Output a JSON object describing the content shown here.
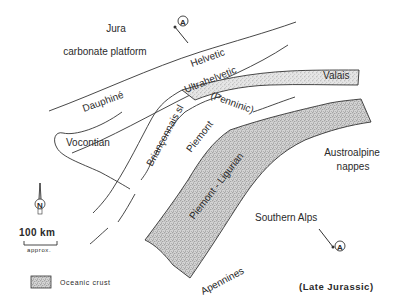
{
  "map": {
    "period": "(Late Jurassic)",
    "colors": {
      "line": "#333333",
      "text": "#2a2a2a",
      "oceanic_fill": "#c9c9c9",
      "background": "#ffffff"
    },
    "regions": {
      "jura": "Jura",
      "carbonate_platform": "carbonate platform",
      "helvetic": "Helvetic",
      "ultrahelvetic": "Ultrahelvetic",
      "dauphine": "Dauphiné",
      "valais": "Valais",
      "penninic": "(Penninic)",
      "brianconnais": "Briançonnais sl",
      "piemont": "Piemont",
      "vocontian": "Vocontian",
      "piemont_ligurian": "Piemont - Ligurian",
      "austroalpine_1": "Austroalpine",
      "austroalpine_2": "nappes",
      "southern_alps": "Southern Alps",
      "apennines": "Apennines"
    },
    "section_markers": {
      "start": "A",
      "end": "A'"
    },
    "north_arrow": {
      "label": "N"
    },
    "scale_bar": {
      "value": "100  km",
      "note": "approx."
    },
    "legend": {
      "items": [
        {
          "label": "Oceanic crust",
          "pattern": "stipple"
        }
      ]
    }
  }
}
